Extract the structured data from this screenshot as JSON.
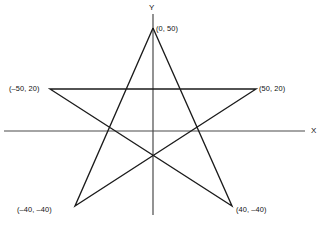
{
  "figure": {
    "background_color": "#ffffff",
    "axis_color": "#4a4a4a",
    "star_color": "#1b1b1b",
    "width": 326,
    "height": 228
  },
  "axes": {
    "x_label": "X",
    "y_label": "Y",
    "origin_px": {
      "x": 153,
      "y": 131
    },
    "x_axis_px": {
      "x1": 4,
      "y1": 131,
      "x2": 305,
      "y2": 131
    },
    "y_axis_px": {
      "x1": 153,
      "y1": 14,
      "x2": 153,
      "y2": 215
    },
    "scale_px_per_unit": 2.06
  },
  "vertex_labels": {
    "top": "(0, 50)",
    "left": "(–50, 20)",
    "right": "(50, 20)",
    "bottom_left": "(–40, –40)",
    "bottom_right": "(40, –40)"
  },
  "chart_data": {
    "type": "scatter",
    "title": "",
    "xlabel": "X",
    "ylabel": "Y",
    "grid": false,
    "legend": "none",
    "xlim": [
      -72,
      74
    ],
    "ylim": [
      -57,
      57
    ],
    "points": [
      {
        "name": "top",
        "label": "(0, 50)",
        "x": 0,
        "y": 50,
        "px": {
          "x": 153,
          "y": 28
        }
      },
      {
        "name": "right",
        "label": "(50, 20)",
        "x": 50,
        "y": 20,
        "px": {
          "x": 256,
          "y": 89
        }
      },
      {
        "name": "bottom_right",
        "label": "(40, –40)",
        "x": 40,
        "y": -40,
        "px": {
          "x": 232,
          "y": 206
        }
      },
      {
        "name": "bottom_left",
        "label": "(–40, –40)",
        "x": -40,
        "y": -40,
        "px": {
          "x": 75,
          "y": 206
        }
      },
      {
        "name": "left",
        "label": "(–50, 20)",
        "x": -50,
        "y": 20,
        "px": {
          "x": 50,
          "y": 89
        }
      }
    ],
    "path_order": [
      "top",
      "bottom_right",
      "left",
      "right",
      "bottom_left",
      "top"
    ],
    "svg_polygon_points": "153,28 232,206 50,89 256,89 75,206 153,28"
  }
}
